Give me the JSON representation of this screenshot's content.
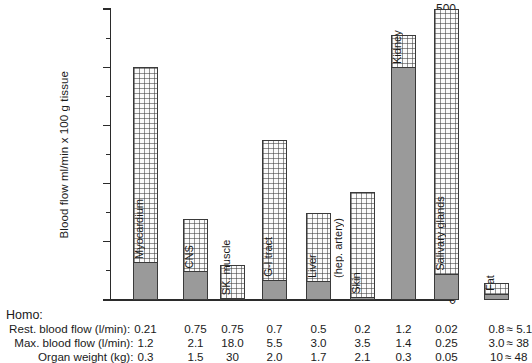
{
  "chart_data": {
    "type": "bar",
    "title": "",
    "xlabel": "",
    "ylabel": "Blood flow ml/min x 100 g tissue",
    "ylim": [
      0,
      500
    ],
    "ytick_labels": [
      "0",
      "100",
      "200",
      "300",
      "400",
      "500"
    ],
    "ytick_values": [
      0,
      100,
      200,
      300,
      400,
      500
    ],
    "minor_tick_values": [
      50,
      150,
      250,
      350,
      450
    ],
    "grid": false,
    "legend": "none",
    "categories": [
      "Myocardium",
      "CNS",
      "SK. muscle",
      "G-I tract",
      "Liver",
      "Skin",
      "Kidney",
      "Salivary glands",
      "Fat"
    ],
    "series": [
      {
        "name": "Rest blood flow per 100 g tissue",
        "values": [
          65,
          50,
          3,
          35,
          33,
          5,
          400,
          45,
          10
        ]
      },
      {
        "name": "Max blood flow per 100 g tissue",
        "values": [
          400,
          140,
          60,
          275,
          150,
          185,
          455,
          500,
          30
        ]
      }
    ],
    "bar_sublabels": {
      "Liver": "(hep. artery)"
    }
  },
  "bars": [
    {
      "name": "Myocardium",
      "label": "Myocardium",
      "sublabel": "",
      "max": 400,
      "rest": 65
    },
    {
      "name": "CNS",
      "label": "CNS",
      "sublabel": "",
      "max": 140,
      "rest": 50
    },
    {
      "name": "SK. muscle",
      "label": "SK. muscle",
      "sublabel": "",
      "max": 60,
      "rest": 3
    },
    {
      "name": "G-I tract",
      "label": "G-I tract",
      "sublabel": "",
      "max": 275,
      "rest": 35
    },
    {
      "name": "Liver",
      "label": "Liver",
      "sublabel": "(hep. artery)",
      "max": 150,
      "rest": 33
    },
    {
      "name": "Skin",
      "label": "Skin",
      "sublabel": "",
      "max": 185,
      "rest": 5
    },
    {
      "name": "Kidney",
      "label": "Kidney",
      "sublabel": "",
      "max": 455,
      "rest": 400
    },
    {
      "name": "Salivary glands",
      "label": "Salivary glands",
      "sublabel": "",
      "max": 500,
      "rest": 45
    },
    {
      "name": "Fat",
      "label": "Fat",
      "sublabel": "",
      "max": 30,
      "rest": 10
    }
  ],
  "axis": {
    "y_title": "Blood flow ml/min x 100 g tissue",
    "labels": [
      "500",
      "400",
      "300",
      "200",
      "100",
      "0"
    ]
  },
  "table": {
    "header": "Homo:",
    "rows": [
      {
        "label": "Rest. blood flow (l/min):",
        "values": [
          "0.21",
          "0.75",
          "0.75",
          "0.7",
          "0.5",
          "0.2",
          "1.2",
          "0.02",
          "0.8"
        ],
        "approx": "≈  5.1"
      },
      {
        "label": "Max. blood flow (l/min):",
        "values": [
          "1.2",
          "2.1",
          "18.0",
          "5.5",
          "3.0",
          "3.5",
          "1.4",
          "0.25",
          "3.0"
        ],
        "approx": "≈ 38"
      },
      {
        "label": "Organ weight (kg):",
        "values": [
          "0.3",
          "1.5",
          "30",
          "2.0",
          "1.7",
          "2.1",
          "0.3",
          "0.05",
          "10"
        ],
        "approx": "≈ 48"
      }
    ]
  },
  "colors": {
    "rest_fill": "#9a9a9a",
    "max_fill": "#fbfbfb",
    "outline": "#3a3a3a",
    "axis": "#2b2b2b",
    "text": "#1a1a1a"
  }
}
